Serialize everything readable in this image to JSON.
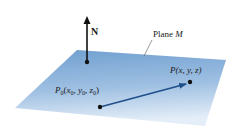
{
  "diagram": {
    "normal_label": "N",
    "plane_label_prefix": "Plane ",
    "plane_label_name": "M",
    "point_p": {
      "name": "P",
      "coords_text": "(x, y, z)"
    },
    "point_p0": {
      "name": "P",
      "subscript": "0",
      "coords": [
        {
          "var": "x",
          "sub": "0"
        },
        {
          "var": "y",
          "sub": "0"
        },
        {
          "var": "z",
          "sub": "0"
        }
      ]
    },
    "colors": {
      "plane_top": "#6f9fd0",
      "plane_bottom": "#dfeaf6",
      "vector": "#1f4f8a",
      "normal": "#111111",
      "point": "#111111"
    }
  }
}
